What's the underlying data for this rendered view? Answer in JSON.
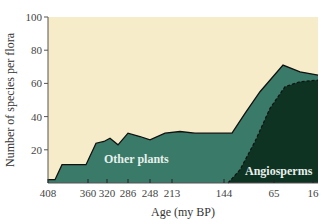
{
  "chart_data": {
    "type": "area",
    "title": "",
    "xlabel": "Age (my BP)",
    "ylabel": "Number of species per flora",
    "ylim": [
      0,
      100
    ],
    "yticks": [
      20,
      40,
      60,
      80,
      100
    ],
    "xticks": [
      "408",
      "360",
      "320",
      "286",
      "248",
      "213",
      "144",
      "65",
      "16"
    ],
    "grid": false,
    "legend": "inline labels",
    "x_tick_pixel_positions": [
      48,
      88,
      107,
      128,
      150,
      172,
      224,
      274,
      313
    ],
    "series": [
      {
        "name": "Other plants",
        "color": "#3a7a68",
        "description": "Total species per flora (top boundary of stacked area)",
        "points": [
          {
            "px": 48,
            "y": 2
          },
          {
            "px": 55,
            "y": 2
          },
          {
            "px": 62,
            "y": 11
          },
          {
            "px": 86,
            "y": 11
          },
          {
            "px": 96,
            "y": 24
          },
          {
            "px": 104,
            "y": 25
          },
          {
            "px": 110,
            "y": 27
          },
          {
            "px": 118,
            "y": 23
          },
          {
            "px": 128,
            "y": 30
          },
          {
            "px": 140,
            "y": 28
          },
          {
            "px": 150,
            "y": 26
          },
          {
            "px": 165,
            "y": 30
          },
          {
            "px": 180,
            "y": 31
          },
          {
            "px": 195,
            "y": 30
          },
          {
            "px": 215,
            "y": 30
          },
          {
            "px": 232,
            "y": 30
          },
          {
            "px": 245,
            "y": 42
          },
          {
            "px": 260,
            "y": 55
          },
          {
            "px": 283,
            "y": 71
          },
          {
            "px": 300,
            "y": 67
          },
          {
            "px": 318,
            "y": 65
          }
        ]
      },
      {
        "name": "Angiosperms",
        "color": "#0f3322",
        "description": "Angiosperm species per flora (bottom stacked area, dashed top edge)",
        "points": [
          {
            "px": 228,
            "y": 0
          },
          {
            "px": 240,
            "y": 8
          },
          {
            "px": 255,
            "y": 25
          },
          {
            "px": 270,
            "y": 45
          },
          {
            "px": 285,
            "y": 58
          },
          {
            "px": 300,
            "y": 61
          },
          {
            "px": 318,
            "y": 62
          }
        ]
      }
    ],
    "annotations": [
      "Other plants",
      "Angiosperms"
    ]
  },
  "labels": {
    "y_title": "Number of species per flora",
    "x_title": "Age (my BP)",
    "other_plants": "Other plants",
    "angiosperms": "Angiosperms",
    "y_ticks": [
      "100",
      "80",
      "60",
      "40",
      "20"
    ],
    "x_ticks": [
      "408",
      "360",
      "320",
      "286",
      "248",
      "213",
      "144",
      "65",
      "16"
    ]
  },
  "colors": {
    "background": "#f7ecc9",
    "other_plants": "#3a7a68",
    "angiosperms": "#0f3322",
    "outline": "#111111"
  }
}
